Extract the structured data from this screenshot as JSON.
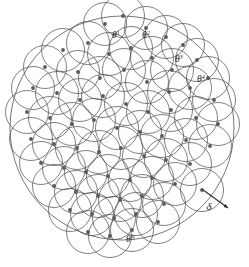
{
  "figure": {
    "name": "delta-coverage-disk-diagram",
    "background_color": "#ffffff",
    "stroke_color": "#4a4a4a",
    "dot_color": "#595959",
    "label_color": "#1a1a1a",
    "width": 249,
    "height": 267,
    "caption_fragment": " "
  },
  "labels": {
    "theta_1": "θ",
    "theta_1_sup": "1",
    "theta_2": "θ",
    "theta_2_sup": "2",
    "theta_3": "θ",
    "theta_3_sup": "3",
    "theta_4": "θ",
    "theta_4_sup": "4",
    "theta_N": "θ",
    "theta_N_sup": "N",
    "delta": "δ"
  },
  "chart_data": {
    "type": "scatter",
    "title": "",
    "xlabel": "",
    "ylabel": "",
    "grid": false,
    "legend": false,
    "xlim": [
      0,
      249
    ],
    "ylim": [
      0,
      267
    ],
    "disk_radius": 21.5,
    "outer_domain": {
      "cx": 122,
      "cy": 128,
      "r": 112
    },
    "radius_arrow": {
      "x1": 202.5,
      "y1": 189.5,
      "x2": 228,
      "y2": 208
    },
    "points": [
      [
        105,
        24
      ],
      [
        146,
        28
      ],
      [
        183,
        45
      ],
      [
        197,
        60
      ],
      [
        123,
        16
      ],
      [
        166,
        37
      ],
      [
        63,
        50
      ],
      [
        88,
        43
      ],
      [
        109,
        54
      ],
      [
        131,
        48
      ],
      [
        152,
        58
      ],
      [
        172,
        70
      ],
      [
        208,
        78
      ],
      [
        45,
        67
      ],
      [
        78,
        72
      ],
      [
        100,
        78
      ],
      [
        124,
        70
      ],
      [
        147,
        82
      ],
      [
        169,
        92
      ],
      [
        190,
        88
      ],
      [
        214,
        100
      ],
      [
        33,
        88
      ],
      [
        57,
        93
      ],
      [
        80,
        100
      ],
      [
        103,
        96
      ],
      [
        126,
        104
      ],
      [
        148,
        112
      ],
      [
        171,
        110
      ],
      [
        196,
        118
      ],
      [
        218,
        124
      ],
      [
        27,
        112
      ],
      [
        50,
        118
      ],
      [
        72,
        124
      ],
      [
        94,
        120
      ],
      [
        117,
        128
      ],
      [
        140,
        132
      ],
      [
        162,
        136
      ],
      [
        186,
        140
      ],
      [
        210,
        146
      ],
      [
        31,
        139
      ],
      [
        54,
        144
      ],
      [
        77,
        148
      ],
      [
        99,
        152
      ],
      [
        121,
        148
      ],
      [
        144,
        156
      ],
      [
        166,
        160
      ],
      [
        190,
        164
      ],
      [
        41,
        163
      ],
      [
        64,
        168
      ],
      [
        86,
        172
      ],
      [
        108,
        176
      ],
      [
        130,
        180
      ],
      [
        152,
        178
      ],
      [
        175,
        184
      ],
      [
        202,
        190
      ],
      [
        54,
        186
      ],
      [
        76,
        192
      ],
      [
        98,
        196
      ],
      [
        120,
        200
      ],
      [
        142,
        196
      ],
      [
        164,
        204
      ],
      [
        70,
        210
      ],
      [
        92,
        214
      ],
      [
        114,
        218
      ],
      [
        136,
        214
      ],
      [
        158,
        222
      ],
      [
        88,
        232
      ],
      [
        110,
        236
      ],
      [
        132,
        230
      ]
    ],
    "annotated_points": [
      {
        "label_key": "theta_1",
        "sup_key": "theta_1_sup",
        "dot": [
          105,
          24
        ],
        "text_xy": [
          112,
          38
        ]
      },
      {
        "label_key": "theta_2",
        "sup_key": "theta_2_sup",
        "dot": [
          146,
          28
        ],
        "text_xy": [
          142,
          38
        ]
      },
      {
        "label_key": "theta_3",
        "sup_key": "theta_3_sup",
        "dot": [
          183,
          45
        ],
        "text_xy": [
          175,
          62
        ]
      },
      {
        "label_key": "theta_4",
        "sup_key": "theta_4_sup",
        "dot": [
          208,
          78
        ],
        "text_xy": [
          197,
          82
        ]
      },
      {
        "label_key": "theta_N",
        "sup_key": "theta_N_sup",
        "dot": [
          120,
          237
        ],
        "text_xy": [
          126,
          242
        ]
      }
    ]
  }
}
